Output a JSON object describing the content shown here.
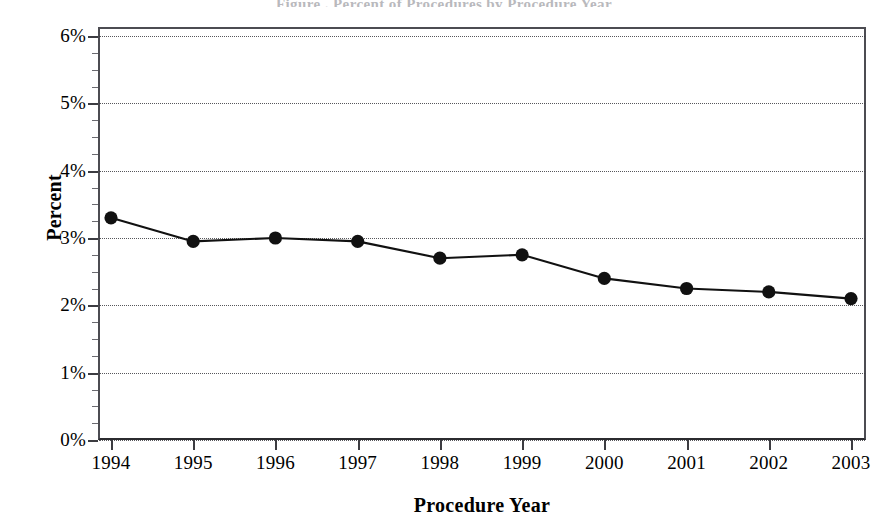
{
  "figure": {
    "title_sliver": "Figure . Percent of Procedures by Procedure Year",
    "background_color": "#ffffff",
    "frame_color": "#3c3c41",
    "series_color": "#111111",
    "grid_color": "#3a3a3f"
  },
  "axes": {
    "ylabel": "Percent",
    "xlabel": "Procedure Year",
    "ytick_labels": [
      "6%",
      "5%",
      "4%",
      "3%",
      "2%",
      "1%",
      "0%"
    ],
    "xtick_labels": [
      "1994",
      "1995",
      "1996",
      "1997",
      "1998",
      "1999",
      "2000",
      "2001",
      "2002",
      "2003"
    ]
  },
  "chart_data": {
    "type": "line",
    "title": "",
    "xlabel": "Procedure Year",
    "ylabel": "Percent",
    "categories": [
      "1994",
      "1995",
      "1996",
      "1997",
      "1998",
      "1999",
      "2000",
      "2001",
      "2002",
      "2003"
    ],
    "values": [
      3.3,
      2.95,
      3.0,
      2.95,
      2.7,
      2.75,
      2.4,
      2.25,
      2.2,
      2.1
    ],
    "value_unit": "%",
    "ylim": [
      0,
      6
    ],
    "ytick_values": [
      0,
      1,
      2,
      3,
      4,
      5,
      6
    ],
    "ytick_labels": [
      "0%",
      "1%",
      "2%",
      "3%",
      "4%",
      "5%",
      "6%"
    ],
    "yminor_step": 0.25,
    "grid": "horizontal-dotted",
    "legend": "none",
    "marker": "filled-circle",
    "series": [
      {
        "name": "Percent",
        "values": [
          3.3,
          2.95,
          3.0,
          2.95,
          2.7,
          2.75,
          2.4,
          2.25,
          2.2,
          2.1
        ]
      }
    ]
  }
}
